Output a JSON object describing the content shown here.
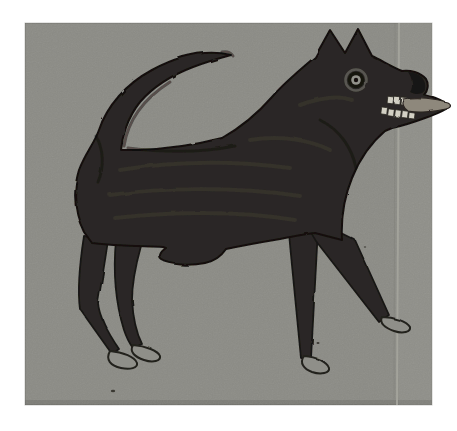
{
  "artwork": {
    "alt_text": "Folk-art painting of a black dog in profile facing right on gray cardboard: pointed ears, round pale eye, open mouth baring two rows of white teeth with tongue sticking out, long tail curling up over the back, four thin legs ending in small unpainted hoof-like feet",
    "subject": "black dog, side view facing right",
    "style": "folk-art silhouette painting, dry brushed dark paint",
    "surface": "gray-brown cardboard sheet with a pale vertical crease near its right edge, surrounded by a white photo margin"
  },
  "colors": {
    "page_background": "#ffffff",
    "cardboard": "#8b8b85",
    "cardboard_light_zone": "#94948d",
    "crease_highlight": "#a7a79f",
    "dog_body": "#2b2825",
    "dog_outline": "#191713",
    "brush_highlight": "#4c4740",
    "brush_shadow": "#0f0d0a",
    "eye_ring": "#17150f",
    "eye_iris": "#92928a",
    "eye_pupil": "#12100c",
    "teeth": "#d3d0c4",
    "tongue": "#8e887c",
    "foot_fill": "#8f8f89",
    "speck": "#3a3832"
  }
}
